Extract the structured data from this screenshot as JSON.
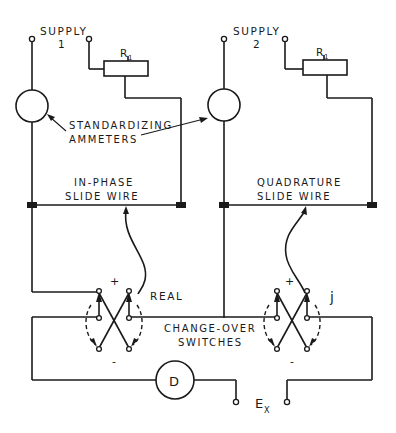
{
  "diagram": {
    "colors": {
      "line": "#1a1a1a",
      "background": "#ffffff"
    },
    "labels": {
      "supply1_word": "SUPPLY",
      "supply1_num": "1",
      "supply2_word": "SUPPLY",
      "supply2_num": "2",
      "r1_left": "R",
      "r1_left_sub": "1",
      "r1_right": "R",
      "r1_right_sub": "1",
      "ammeters_line1": "STANDARDIZING",
      "ammeters_line2": "AMMETERS",
      "inphase_line1": "IN-PHASE",
      "inphase_line2": "SLIDE WIRE",
      "quad_line1": "QUADRATURE",
      "quad_line2": "SLIDE WIRE",
      "real": "REAL",
      "j": "j",
      "plus_left": "+",
      "minus_left": "-",
      "plus_right": "+",
      "minus_right": "-",
      "changeover_line1": "CHANGE-OVER",
      "changeover_line2": "SWITCHES",
      "detector": "D",
      "ex": "E",
      "ex_sub": "X"
    },
    "components": [
      {
        "id": "supply-1",
        "type": "terminal-pair"
      },
      {
        "id": "supply-2",
        "type": "terminal-pair"
      },
      {
        "id": "rheostat-r1-left",
        "type": "variable-resistor"
      },
      {
        "id": "rheostat-r1-right",
        "type": "variable-resistor"
      },
      {
        "id": "ammeter-left",
        "type": "ammeter"
      },
      {
        "id": "ammeter-right",
        "type": "ammeter"
      },
      {
        "id": "in-phase-slide-wire",
        "type": "slide-wire"
      },
      {
        "id": "quadrature-slide-wire",
        "type": "slide-wire"
      },
      {
        "id": "changeover-switch-real",
        "type": "reversing-switch"
      },
      {
        "id": "changeover-switch-j",
        "type": "reversing-switch"
      },
      {
        "id": "detector-d",
        "type": "detector"
      },
      {
        "id": "ex-terminals",
        "type": "terminal-pair"
      }
    ]
  }
}
